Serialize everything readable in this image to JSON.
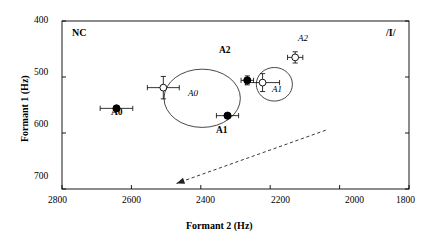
{
  "chart_data": {
    "type": "scatter",
    "title": "",
    "xlabel": "Formant 2 (Hz)",
    "ylabel": "Formant 1 (Hz)",
    "xlim": [
      2800,
      1800
    ],
    "ylim": [
      400,
      700
    ],
    "x_ticks": [
      2800,
      2600,
      2400,
      2200,
      2000,
      1800
    ],
    "y_ticks": [
      400,
      500,
      600,
      700
    ],
    "x_tick_labels": [
      "2800",
      "2600",
      "2400",
      "2200",
      "2000",
      "1800"
    ],
    "y_tick_labels": [
      "400",
      "500",
      "600",
      "700"
    ],
    "x_axis_inverted": true,
    "y_axis_inverted": true,
    "grid": false,
    "legend": false,
    "corner_labels": {
      "top_left": "NC",
      "top_right": "/I/"
    },
    "series": [
      {
        "name": "A0",
        "marker": "filled-circle",
        "label": "A0",
        "label_style": "bold",
        "label_position": "below",
        "x": 2643,
        "y": 556,
        "xerr": 47,
        "yerr": 0
      },
      {
        "name": "A1",
        "marker": "filled-circle",
        "label": "A1",
        "label_style": "bold",
        "label_position": "below",
        "x": 2323,
        "y": 569,
        "xerr": 32,
        "yerr": 0
      },
      {
        "name": "A2",
        "marker": "filled-circle",
        "label": "A2",
        "label_style": "bold",
        "label_position": "left",
        "x": 2266,
        "y": 506,
        "xerr": 18,
        "yerr": 8
      },
      {
        "name": "A0-open",
        "marker": "open-circle",
        "label": "A0",
        "label_style": "italic",
        "label_position": "below-right",
        "x": 2508,
        "y": 519,
        "xerr": 46,
        "yerr": 20
      },
      {
        "name": "A1-open",
        "marker": "open-circle",
        "label": "A1",
        "label_style": "italic",
        "label_position": "below-right",
        "x": 2222,
        "y": 510,
        "xerr": 49,
        "yerr": 16
      },
      {
        "name": "A2-open",
        "marker": "open-circle",
        "label": "A2",
        "label_style": "italic",
        "label_position": "above",
        "x": 2128,
        "y": 465,
        "xerr": 22,
        "yerr": 10
      }
    ],
    "ellipses": [
      {
        "name": "cluster-a0",
        "cx": 2396,
        "cy": 538,
        "rx": 110,
        "ry": 52,
        "label": "A1",
        "label_style": "bold"
      },
      {
        "name": "cluster-a1",
        "cx": 2188,
        "cy": 513,
        "rx": 52,
        "ry": 30,
        "label": "A1",
        "label_style": "italic"
      }
    ],
    "annotations": [
      {
        "name": "trend-arrow",
        "type": "dashed-arrow",
        "x_start": 2040,
        "y_start": 595,
        "x_end": 2470,
        "y_end": 690,
        "arrowhead_at": "end"
      }
    ]
  },
  "axis": {
    "x_title": "Formant 2 (Hz)",
    "y_title": "Formant 1 (Hz)"
  },
  "labels": {
    "nc": "NC",
    "phoneme": "/I/",
    "bold_a0": "A0",
    "bold_a1": "A1",
    "bold_a2": "A2",
    "ital_a0": "A0",
    "ital_a1": "A1",
    "ital_a2": "A2",
    "ellipse_a1_bold": "A1"
  },
  "ticks": {
    "x": [
      "2800",
      "2600",
      "2400",
      "2200",
      "2000",
      "1800"
    ],
    "y": [
      "400",
      "500",
      "600",
      "700"
    ]
  },
  "colors": {
    "axis": "#000000",
    "marker_fill": "#000000",
    "marker_open": "#ffffff",
    "ellipse": "#333333",
    "arrow": "#222222"
  }
}
